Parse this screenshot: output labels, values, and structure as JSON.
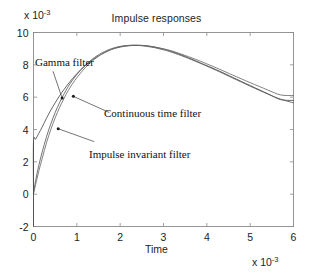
{
  "chart_data": {
    "type": "line",
    "title": "Impulse responses",
    "xlabel": "Time",
    "ylabel": "",
    "x_multiplier_prefix": "x 10",
    "x_multiplier_exp": "-3",
    "y_multiplier_prefix": "x 10",
    "y_multiplier_exp": "-3",
    "xlim": [
      0,
      6
    ],
    "ylim": [
      -2,
      10
    ],
    "xticks": [
      0,
      1,
      2,
      3,
      4,
      5,
      6
    ],
    "yticks": [
      -2,
      0,
      2,
      4,
      6,
      8,
      10
    ],
    "xtick_labels": [
      "0",
      "1",
      "2",
      "3",
      "4",
      "5",
      "6"
    ],
    "ytick_labels": [
      "-2",
      "0",
      "2",
      "4",
      "6",
      "8",
      "10"
    ],
    "grid": false,
    "legend_position": "none",
    "axis_box": true,
    "series": [
      {
        "name": "Gamma filter",
        "color": "#4a4a4a",
        "x": [
          0,
          0.0,
          0.05,
          0.12,
          0.2,
          0.3,
          0.4,
          0.5,
          0.6,
          0.7,
          0.8,
          0.9,
          1.0,
          1.1,
          1.2,
          1.3,
          1.4,
          1.5,
          1.6,
          1.8,
          2.0,
          2.2,
          2.4,
          2.6,
          2.8,
          3.0,
          3.2,
          3.5,
          3.8,
          4.0,
          4.3,
          4.6,
          5.0,
          5.4,
          5.7,
          6.0
        ],
        "y": [
          0.0,
          3.25,
          3.4,
          3.75,
          4.15,
          4.7,
          5.2,
          5.65,
          6.08,
          6.46,
          6.82,
          7.15,
          7.45,
          7.72,
          7.96,
          8.18,
          8.38,
          8.55,
          8.7,
          8.95,
          9.1,
          9.18,
          9.2,
          9.18,
          9.1,
          8.98,
          8.82,
          8.52,
          8.18,
          7.95,
          7.6,
          7.22,
          6.72,
          6.22,
          5.85,
          5.8
        ]
      },
      {
        "name": "Continuous time filter",
        "color": "#5a5a5a",
        "x": [
          0,
          0.05,
          0.12,
          0.2,
          0.3,
          0.4,
          0.5,
          0.6,
          0.7,
          0.8,
          0.9,
          1.0,
          1.1,
          1.2,
          1.3,
          1.4,
          1.5,
          1.6,
          1.8,
          2.0,
          2.2,
          2.4,
          2.6,
          2.8,
          3.0,
          3.2,
          3.5,
          3.8,
          4.0,
          4.3,
          4.6,
          5.0,
          5.4,
          5.7,
          6.0
        ],
        "y": [
          0.05,
          0.85,
          1.75,
          2.6,
          3.55,
          4.35,
          5.05,
          5.65,
          6.18,
          6.65,
          7.05,
          7.4,
          7.72,
          7.99,
          8.23,
          8.44,
          8.62,
          8.77,
          9.0,
          9.14,
          9.2,
          9.2,
          9.15,
          9.06,
          8.93,
          8.77,
          8.48,
          8.15,
          7.92,
          7.56,
          7.18,
          6.68,
          6.2,
          5.88,
          5.65
        ]
      },
      {
        "name": "Impulse invariant filter",
        "color": "#6a6a6a",
        "x": [
          0,
          0.05,
          0.12,
          0.2,
          0.3,
          0.4,
          0.5,
          0.6,
          0.7,
          0.8,
          0.9,
          1.0,
          1.1,
          1.2,
          1.3,
          1.4,
          1.5,
          1.6,
          1.8,
          2.0,
          2.2,
          2.4,
          2.6,
          2.8,
          3.0,
          3.2,
          3.5,
          3.8,
          4.0,
          4.3,
          4.6,
          5.0,
          5.4,
          5.7,
          6.0
        ],
        "y": [
          0.05,
          0.6,
          1.4,
          2.2,
          3.18,
          4.0,
          4.72,
          5.35,
          5.9,
          6.4,
          6.83,
          7.2,
          7.54,
          7.84,
          8.1,
          8.33,
          8.53,
          8.7,
          8.96,
          9.12,
          9.2,
          9.22,
          9.18,
          9.1,
          8.99,
          8.85,
          8.58,
          8.28,
          8.06,
          7.72,
          7.36,
          6.9,
          6.45,
          6.14,
          6.1
        ]
      }
    ],
    "impulse_stem": {
      "x": 0,
      "y_top": 3.25,
      "y_bottom": -2
    },
    "annotations": [
      {
        "id": "gamma",
        "text": "Gamma filter",
        "arrow_from": [
          0.45,
          7.6
        ],
        "arrow_to": [
          0.66,
          5.95
        ]
      },
      {
        "id": "continuous",
        "text": "Continuous time filter",
        "arrow_from": [
          1.75,
          5.05
        ],
        "arrow_to": [
          0.92,
          6.05
        ]
      },
      {
        "id": "impulse",
        "text": "Impulse invariant filter",
        "arrow_from": [
          1.4,
          3.25
        ],
        "arrow_to": [
          0.57,
          4.05
        ]
      }
    ]
  },
  "style": {
    "axis_color": "#8a8a8a",
    "text_color": "#1d1d1d",
    "background": "#ffffff"
  }
}
